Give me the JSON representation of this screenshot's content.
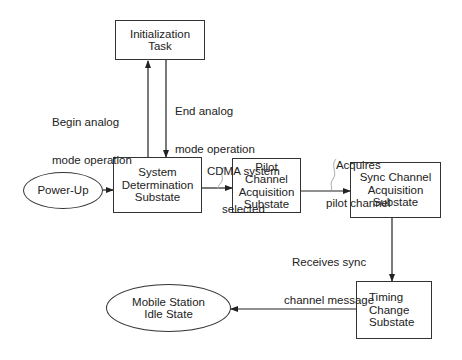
{
  "nodes": {
    "init_task": {
      "line1": "Initialization",
      "line2": "Task"
    },
    "power_up": {
      "line1": "Power-Up"
    },
    "system_determination": {
      "line1": "System",
      "line2": "Determination",
      "line3": "Substate"
    },
    "pilot_acquisition": {
      "line1": "Pilot Channel",
      "line2": "Acquisition",
      "line3": "Substate"
    },
    "sync_acquisition": {
      "line1": "Sync Channel",
      "line2": "Acquisition",
      "line3": "Substate"
    },
    "timing_change": {
      "line1": "Timing",
      "line2": "Change",
      "line3": "Substate"
    },
    "idle_state": {
      "line1": "Mobile Station",
      "line2": "Idle State"
    }
  },
  "edges": {
    "begin_analog": {
      "line1": "Begin analog",
      "line2": "mode operation"
    },
    "end_analog": {
      "line1": "End analog",
      "line2": "mode operation"
    },
    "cdma_selected": {
      "line1": "CDMA system",
      "line2": "selected"
    },
    "acquires_pilot": {
      "line1": "Acquires",
      "line2": "pilot channel"
    },
    "receives_sync": {
      "line1": "Receives sync",
      "line2": "channel message"
    }
  },
  "colors": {
    "stroke": "#333333",
    "background": "#ffffff"
  }
}
